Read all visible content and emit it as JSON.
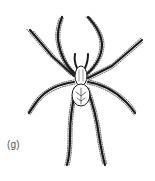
{
  "figure": {
    "label": "(g)",
    "style": "black-and-white line drawing",
    "colors": {
      "background": "#ffffff",
      "ink": "#1a1a1a",
      "label": "#555555"
    }
  }
}
